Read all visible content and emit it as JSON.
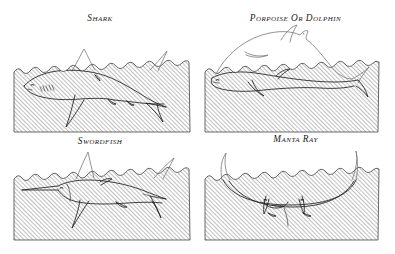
{
  "figure": {
    "kind": "natural-history-plate",
    "background_color": "#ffffff",
    "ink_color": "#1a1a1a",
    "hatch_color": "#8a8a8a",
    "above_water_line_color": "#777777",
    "panel_count": 4,
    "panels": [
      {
        "id": "shark",
        "caption": "Shark",
        "position": "top-left",
        "water_rect": {
          "x": 14,
          "y": 67,
          "w": 176,
          "h": 65
        },
        "subject": "shark",
        "above_surface_parts": [
          "dorsal fin",
          "upper tail lobe"
        ],
        "below_surface_parts": [
          "head",
          "body",
          "pectoral fin",
          "pelvic fin",
          "anal fin",
          "lower tail lobe"
        ],
        "detail_marks": [
          "eye",
          "gill slits",
          "nostril"
        ],
        "facing": "left"
      },
      {
        "id": "dolphin",
        "caption": "Porpoise or Dolphin",
        "position": "top-right",
        "water_rect": {
          "x": 205,
          "y": 67,
          "w": 173,
          "h": 65
        },
        "subject": "porpoise or dolphin",
        "above_surface_parts": [
          "leaping body arc",
          "dorsal fin",
          "beak",
          "flukes"
        ],
        "below_surface_parts": [
          "swimming body",
          "flipper",
          "tail stock",
          "flukes"
        ],
        "detail_marks": [
          "eye",
          "blowhole",
          "mouth line"
        ],
        "facing": "right"
      },
      {
        "id": "swordfish",
        "caption": "Swordfish",
        "position": "bottom-left",
        "water_rect": {
          "x": 14,
          "y": 174,
          "w": 176,
          "h": 66
        },
        "subject": "swordfish",
        "above_surface_parts": [
          "tall dorsal fin",
          "upper tail lobe"
        ],
        "below_surface_parts": [
          "sword bill",
          "head",
          "body",
          "pectoral fin",
          "pelvic fin",
          "second dorsal",
          "anal fin",
          "lower tail lobe"
        ],
        "detail_marks": [
          "eye",
          "gill cover",
          "keel"
        ],
        "facing": "left"
      },
      {
        "id": "mantaray",
        "caption": "Manta Ray",
        "position": "bottom-right",
        "water_rect": {
          "x": 205,
          "y": 174,
          "w": 173,
          "h": 66
        },
        "subject": "manta ray",
        "above_surface_parts": [
          "left wingtip",
          "right wingtip"
        ],
        "below_surface_parts": [
          "wing span",
          "body disc",
          "cephalic lobes",
          "tail"
        ],
        "detail_marks": [
          "eye left",
          "eye right",
          "mouth"
        ],
        "facing": "viewer"
      }
    ],
    "surface_style": {
      "description": "irregular wavy water line along panel top",
      "hatching": "diagonal parallel lines rising left-to-right beneath surface"
    }
  }
}
